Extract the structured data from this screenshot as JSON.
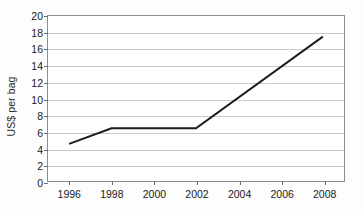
{
  "chart_data": {
    "type": "line",
    "title": "",
    "subtitle": "",
    "xlabel": "",
    "ylabel": "US$ per bag",
    "xlim": [
      1995,
      2009
    ],
    "ylim": [
      0,
      20
    ],
    "x_ticks": [
      1996,
      1998,
      2000,
      2002,
      2004,
      2006,
      2008
    ],
    "x_tick_labels": [
      "1996",
      "1998",
      "2000",
      "2002",
      "2004",
      "2006",
      "2008"
    ],
    "y_ticks": [
      0,
      2,
      4,
      6,
      8,
      10,
      12,
      14,
      16,
      18,
      20
    ],
    "y_tick_labels": [
      "0",
      "2",
      "4",
      "6",
      "8",
      "10",
      "12",
      "14",
      "16",
      "18",
      "20"
    ],
    "grid": "horizontal",
    "legend": "none",
    "series": [
      {
        "name": "US$ per bag",
        "color": "#1c1c1c",
        "x": [
          1996,
          1998,
          2002,
          2008
        ],
        "values": [
          4.5,
          6.4,
          6.4,
          17.5
        ]
      }
    ],
    "annotations": []
  },
  "colors": {
    "line": "#1c1c1c",
    "grid": "#c9c9c9",
    "frame": "#8e8e8e",
    "text": "#1a1a1a",
    "background": "#fdfdfd"
  }
}
